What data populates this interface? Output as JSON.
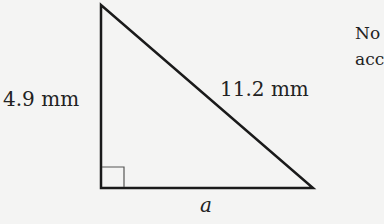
{
  "diagram": {
    "type": "right-triangle",
    "labels": {
      "vertical_side": "4.9 mm",
      "hypotenuse": "11.2 mm",
      "base": "a"
    },
    "right_angle_marker": true,
    "stroke_color": "#1a1a1a"
  },
  "side_text": {
    "line1": "No",
    "line2": "acc"
  }
}
